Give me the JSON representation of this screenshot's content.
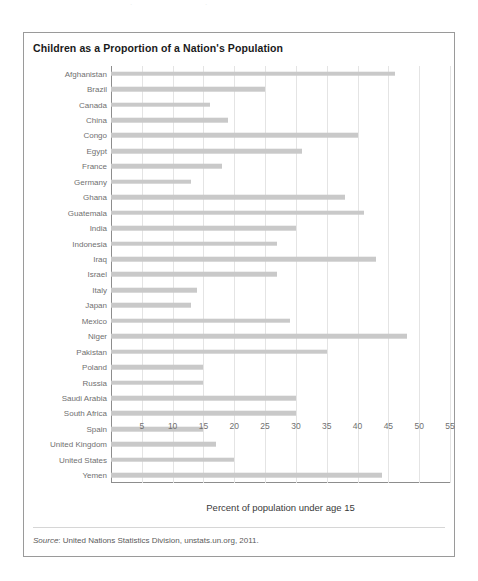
{
  "figure": {
    "title": "Children as a Proportion of a Nation's Population",
    "source_prefix": "Source",
    "source_text": ": United Nations Statistics Division, unstats.un.org, 2011.",
    "bar_color": "#c9c9c9",
    "grid_color": "#e4e4e4",
    "axis_color": "#8d8d8d",
    "frame_color": "#9a9a9a"
  },
  "chart_data": {
    "type": "bar",
    "orientation": "horizontal",
    "title": "Children as a Proportion of a Nation's Population",
    "xlabel": "Percent of population under age 15",
    "ylabel": "",
    "xlim": [
      0,
      55
    ],
    "xticks": [
      5,
      10,
      15,
      20,
      25,
      30,
      35,
      40,
      45,
      50,
      55
    ],
    "grid": "vertical",
    "legend": "none",
    "categories": [
      "Afghanistan",
      "Brazil",
      "Canada",
      "China",
      "Congo",
      "Egypt",
      "France",
      "Germany",
      "Ghana",
      "Guatemala",
      "India",
      "Indonesia",
      "Iraq",
      "Israel",
      "Italy",
      "Japan",
      "Mexico",
      "Niger",
      "Pakistan",
      "Poland",
      "Russia",
      "Saudi Arabia",
      "South Africa",
      "Spain",
      "United Kingdom",
      "United States",
      "Yemen"
    ],
    "values": [
      46,
      25,
      16,
      19,
      40,
      31,
      18,
      13,
      38,
      41,
      30,
      27,
      43,
      27,
      14,
      13,
      29,
      48,
      35,
      15,
      15,
      30,
      30,
      15,
      17,
      20,
      44
    ]
  }
}
